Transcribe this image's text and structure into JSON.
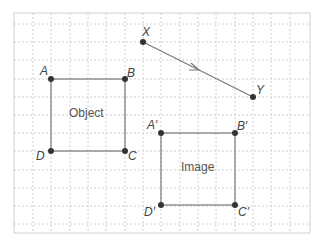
{
  "diagram": {
    "type": "translation-on-grid",
    "colors": {
      "frame": "#d0d0d0",
      "grid": "#bdbdbd",
      "line": "#777777",
      "point": "#333333",
      "text": "#444444"
    },
    "grid": {
      "x0": 14,
      "y0": 5.6,
      "step": 18.35,
      "cols": 16,
      "rows": 12
    },
    "object": {
      "label": "Object",
      "points": [
        {
          "name": "A",
          "label": "A"
        },
        {
          "name": "B",
          "label": "B"
        },
        {
          "name": "C",
          "label": "C"
        },
        {
          "name": "D",
          "label": "D"
        }
      ]
    },
    "image": {
      "label": "Image",
      "points": [
        {
          "name": "A'",
          "label": "A′"
        },
        {
          "name": "B'",
          "label": "B′"
        },
        {
          "name": "C'",
          "label": "C′"
        },
        {
          "name": "D'",
          "label": "D′"
        }
      ]
    },
    "vector": {
      "start": "X",
      "end": "Y"
    }
  }
}
